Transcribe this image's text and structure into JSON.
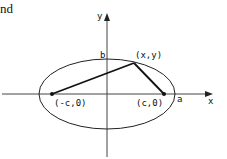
{
  "text_fragment": "nd",
  "diagram": {
    "type": "ellipse-foci",
    "axes": {
      "x_label": "x",
      "y_label": "y"
    },
    "labels": {
      "b": "b",
      "a": "a",
      "point": "(x,y)",
      "left_focus": "(-c,0)",
      "right_focus": "(c,0)"
    },
    "colors": {
      "stroke": "#111111",
      "axis": "#333333",
      "background": "#ffffff"
    }
  }
}
